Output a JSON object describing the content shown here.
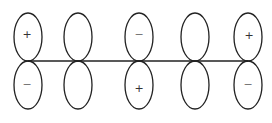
{
  "diagram": {
    "type": "p-orbital-lobes",
    "line": {
      "x1": 28,
      "x2": 248,
      "y": 61
    },
    "orbitals": [
      {
        "cx": 28,
        "top": "+",
        "bottom": "−"
      },
      {
        "cx": 78,
        "top": "",
        "bottom": ""
      },
      {
        "cx": 139,
        "top": "−",
        "bottom": "+"
      },
      {
        "cx": 195,
        "top": "",
        "bottom": ""
      },
      {
        "cx": 248,
        "top": "+",
        "bottom": "−"
      }
    ]
  }
}
